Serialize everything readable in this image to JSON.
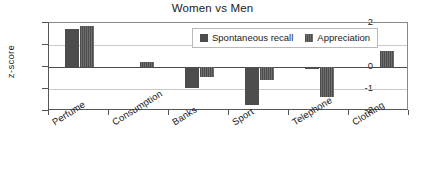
{
  "chart_data": {
    "type": "bar",
    "title": "Women vs Men",
    "xlabel": "",
    "ylabel": "z-score",
    "ylim": [
      -2,
      2
    ],
    "yticks": [
      2,
      1,
      0,
      -1,
      -2
    ],
    "ytick_labels": [
      "2",
      "1",
      "0",
      "-1",
      "-2"
    ],
    "grid": true,
    "legend_position": "top-right",
    "categories": [
      "Perfume",
      "Consumption",
      "Banks",
      "Sport",
      "Telephone",
      "Clothing"
    ],
    "series": [
      {
        "name": "Spontaneous recall",
        "color": "#4d4d4d",
        "values": [
          1.75,
          0,
          -0.95,
          -1.72,
          -0.1,
          0
        ]
      },
      {
        "name": "Appreciation",
        "color": "#4d4d4d",
        "values": [
          1.85,
          0.23,
          -0.45,
          -0.6,
          -1.35,
          0.72
        ]
      }
    ]
  },
  "legend": {
    "entries": [
      {
        "label": "Spontaneous recall"
      },
      {
        "label": "Appreciation"
      }
    ]
  }
}
